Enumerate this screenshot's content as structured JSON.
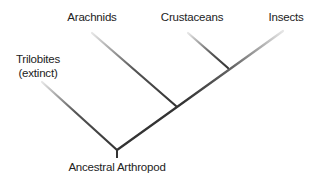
{
  "diagram": {
    "type": "cladogram",
    "root": {
      "label": "Ancestral Arthropod"
    },
    "taxa": [
      {
        "id": "trilobites",
        "label_line1": "Trilobites",
        "label_line2": "(extinct)"
      },
      {
        "id": "arachnids",
        "label": "Arachnids"
      },
      {
        "id": "crustaceans",
        "label": "Crustaceans"
      },
      {
        "id": "insects",
        "label": "Insects"
      }
    ],
    "colors": {
      "line": "#333333",
      "line_fade": "#dddddd",
      "text": "#222222"
    }
  }
}
